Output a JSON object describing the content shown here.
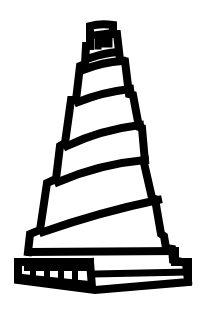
{
  "image": {
    "subject": "spiral-minaret-tower-icon",
    "style": "black line icon on white background",
    "colors": {
      "ink": "#000000",
      "background": "#ffffff"
    },
    "tiers": 6,
    "base_teeth": 4
  }
}
